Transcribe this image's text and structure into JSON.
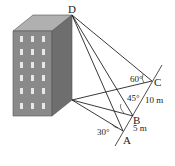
{
  "diagram": {
    "type": "geometry-3d",
    "points": {
      "D": {
        "label": "D"
      },
      "A": {
        "label": "A"
      },
      "B": {
        "label": "B"
      },
      "C": {
        "label": "C"
      }
    },
    "angles": {
      "at_A": "30°",
      "at_B": "45°",
      "at_C": "60°"
    },
    "lengths": {
      "AB": "5 m",
      "BC": "10 m"
    },
    "colors": {
      "building_front": "#8a8a8a",
      "building_side": "#6e6e6e",
      "building_top": "#b0b0b0",
      "windows": "#e8e8e8",
      "lines": "#222222"
    }
  }
}
